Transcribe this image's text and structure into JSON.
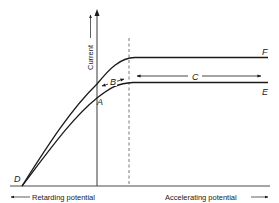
{
  "diagram": {
    "y_axis_label": "Current",
    "x_axis_left_label": "Retarding potential",
    "x_axis_right_label": "Accelerating potential",
    "curves": [
      {
        "id": "upper",
        "end_label": "F"
      },
      {
        "id": "lower",
        "end_label": "E"
      }
    ],
    "point_labels": {
      "origin_point": "D",
      "lower_curve_point": "A",
      "rise_region": "B",
      "saturation_region": "C"
    },
    "colors": {
      "line": "#1a1a1a",
      "axis": "#4a4a4a",
      "background": "#ffffff"
    }
  }
}
